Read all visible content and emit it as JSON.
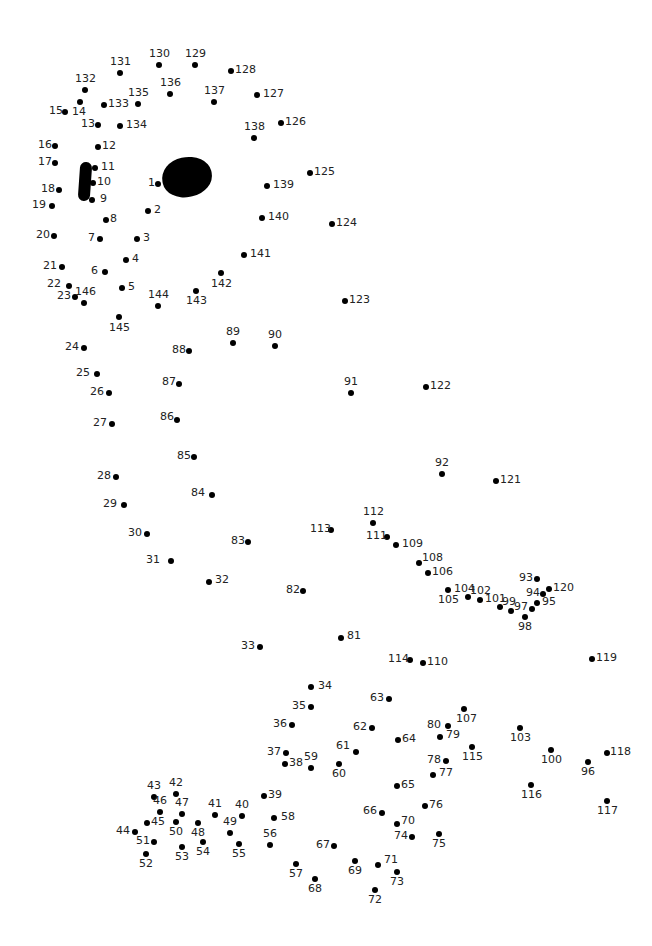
{
  "puzzle": {
    "type": "connect-the-dots",
    "dot_count": 146,
    "features": [
      {
        "name": "eye",
        "shape": "filled-oval"
      },
      {
        "name": "nostril",
        "shape": "filled-bar"
      }
    ],
    "dots": [
      {
        "n": "1",
        "x": 158,
        "y": 184,
        "lx": -10,
        "ly": -7
      },
      {
        "n": "2",
        "x": 148,
        "y": 211,
        "lx": 6,
        "ly": -7
      },
      {
        "n": "3",
        "x": 137,
        "y": 239,
        "lx": 6,
        "ly": -7
      },
      {
        "n": "4",
        "x": 126,
        "y": 260,
        "lx": 6,
        "ly": -7
      },
      {
        "n": "5",
        "x": 122,
        "y": 288,
        "lx": 6,
        "ly": -7
      },
      {
        "n": "6",
        "x": 105,
        "y": 272,
        "lx": -14,
        "ly": -7
      },
      {
        "n": "7",
        "x": 100,
        "y": 239,
        "lx": -12,
        "ly": -7
      },
      {
        "n": "8",
        "x": 106,
        "y": 220,
        "lx": 4,
        "ly": -7
      },
      {
        "n": "9",
        "x": 92,
        "y": 200,
        "lx": 8,
        "ly": -7
      },
      {
        "n": "10",
        "x": 93,
        "y": 183,
        "lx": 4,
        "ly": -7
      },
      {
        "n": "11",
        "x": 95,
        "y": 168,
        "lx": 6,
        "ly": -7
      },
      {
        "n": "12",
        "x": 98,
        "y": 147,
        "lx": 4,
        "ly": -7
      },
      {
        "n": "13",
        "x": 98,
        "y": 125,
        "lx": -17,
        "ly": -7
      },
      {
        "n": "14",
        "x": 80,
        "y": 102,
        "lx": -8,
        "ly": 4
      },
      {
        "n": "15",
        "x": 65,
        "y": 112,
        "lx": -16,
        "ly": -7
      },
      {
        "n": "16",
        "x": 55,
        "y": 146,
        "lx": -17,
        "ly": -7
      },
      {
        "n": "17",
        "x": 55,
        "y": 163,
        "lx": -17,
        "ly": -7
      },
      {
        "n": "18",
        "x": 59,
        "y": 190,
        "lx": -18,
        "ly": -7
      },
      {
        "n": "19",
        "x": 52,
        "y": 206,
        "lx": -20,
        "ly": -7
      },
      {
        "n": "20",
        "x": 54,
        "y": 236,
        "lx": -18,
        "ly": -7
      },
      {
        "n": "21",
        "x": 62,
        "y": 267,
        "lx": -19,
        "ly": -7
      },
      {
        "n": "22",
        "x": 69,
        "y": 286,
        "lx": -22,
        "ly": -8
      },
      {
        "n": "23",
        "x": 75,
        "y": 297,
        "lx": -18,
        "ly": -7
      },
      {
        "n": "24",
        "x": 84,
        "y": 348,
        "lx": -19,
        "ly": -7
      },
      {
        "n": "25",
        "x": 97,
        "y": 374,
        "lx": -21,
        "ly": -7
      },
      {
        "n": "26",
        "x": 109,
        "y": 393,
        "lx": -19,
        "ly": -7
      },
      {
        "n": "27",
        "x": 112,
        "y": 424,
        "lx": -19,
        "ly": -7
      },
      {
        "n": "28",
        "x": 116,
        "y": 477,
        "lx": -19,
        "ly": -7
      },
      {
        "n": "29",
        "x": 124,
        "y": 505,
        "lx": -21,
        "ly": -7
      },
      {
        "n": "30",
        "x": 147,
        "y": 534,
        "lx": -19,
        "ly": -7
      },
      {
        "n": "31",
        "x": 171,
        "y": 561,
        "lx": -25,
        "ly": -7
      },
      {
        "n": "32",
        "x": 209,
        "y": 582,
        "lx": 6,
        "ly": -8
      },
      {
        "n": "33",
        "x": 260,
        "y": 647,
        "lx": -19,
        "ly": -7
      },
      {
        "n": "34",
        "x": 311,
        "y": 687,
        "lx": 7,
        "ly": -7
      },
      {
        "n": "35",
        "x": 311,
        "y": 707,
        "lx": -19,
        "ly": -7
      },
      {
        "n": "36",
        "x": 292,
        "y": 725,
        "lx": -19,
        "ly": -7
      },
      {
        "n": "37",
        "x": 286,
        "y": 753,
        "lx": -19,
        "ly": -7
      },
      {
        "n": "38",
        "x": 285,
        "y": 764,
        "lx": 4,
        "ly": -7
      },
      {
        "n": "39",
        "x": 264,
        "y": 796,
        "lx": 4,
        "ly": -7
      },
      {
        "n": "40",
        "x": 242,
        "y": 816,
        "lx": -7,
        "ly": -17
      },
      {
        "n": "41",
        "x": 215,
        "y": 815,
        "lx": -7,
        "ly": -17
      },
      {
        "n": "42",
        "x": 176,
        "y": 794,
        "lx": -7,
        "ly": -17
      },
      {
        "n": "43",
        "x": 154,
        "y": 797,
        "lx": -7,
        "ly": -17
      },
      {
        "n": "44",
        "x": 135,
        "y": 832,
        "lx": -19,
        "ly": -7
      },
      {
        "n": "45",
        "x": 147,
        "y": 823,
        "lx": 4,
        "ly": -7
      },
      {
        "n": "46",
        "x": 160,
        "y": 812,
        "lx": -7,
        "ly": -17
      },
      {
        "n": "47",
        "x": 182,
        "y": 814,
        "lx": -7,
        "ly": -17
      },
      {
        "n": "48",
        "x": 198,
        "y": 823,
        "lx": -7,
        "ly": 4
      },
      {
        "n": "49",
        "x": 230,
        "y": 833,
        "lx": -7,
        "ly": -17
      },
      {
        "n": "50",
        "x": 176,
        "y": 822,
        "lx": -7,
        "ly": 4
      },
      {
        "n": "51",
        "x": 154,
        "y": 842,
        "lx": -18,
        "ly": -7
      },
      {
        "n": "52",
        "x": 146,
        "y": 854,
        "lx": -7,
        "ly": 4
      },
      {
        "n": "53",
        "x": 182,
        "y": 847,
        "lx": -7,
        "ly": 4
      },
      {
        "n": "54",
        "x": 203,
        "y": 842,
        "lx": -7,
        "ly": 4
      },
      {
        "n": "55",
        "x": 239,
        "y": 844,
        "lx": -7,
        "ly": 4
      },
      {
        "n": "56",
        "x": 270,
        "y": 845,
        "lx": -7,
        "ly": -17
      },
      {
        "n": "57",
        "x": 296,
        "y": 864,
        "lx": -7,
        "ly": 4
      },
      {
        "n": "58",
        "x": 274,
        "y": 818,
        "lx": 7,
        "ly": -7
      },
      {
        "n": "59",
        "x": 311,
        "y": 768,
        "lx": -7,
        "ly": -17
      },
      {
        "n": "60",
        "x": 339,
        "y": 764,
        "lx": -7,
        "ly": 4
      },
      {
        "n": "61",
        "x": 356,
        "y": 752,
        "lx": -20,
        "ly": -12
      },
      {
        "n": "62",
        "x": 372,
        "y": 728,
        "lx": -19,
        "ly": -7
      },
      {
        "n": "63",
        "x": 389,
        "y": 699,
        "lx": -19,
        "ly": -7
      },
      {
        "n": "64",
        "x": 398,
        "y": 740,
        "lx": 4,
        "ly": -7
      },
      {
        "n": "65",
        "x": 397,
        "y": 786,
        "lx": 4,
        "ly": -7
      },
      {
        "n": "66",
        "x": 382,
        "y": 813,
        "lx": -19,
        "ly": -8
      },
      {
        "n": "67",
        "x": 334,
        "y": 846,
        "lx": -18,
        "ly": -7
      },
      {
        "n": "68",
        "x": 315,
        "y": 879,
        "lx": -7,
        "ly": 4
      },
      {
        "n": "69",
        "x": 355,
        "y": 861,
        "lx": -7,
        "ly": 4
      },
      {
        "n": "70",
        "x": 397,
        "y": 824,
        "lx": 4,
        "ly": -9
      },
      {
        "n": "71",
        "x": 378,
        "y": 865,
        "lx": 6,
        "ly": -11
      },
      {
        "n": "72",
        "x": 375,
        "y": 890,
        "lx": -7,
        "ly": 4
      },
      {
        "n": "73",
        "x": 397,
        "y": 872,
        "lx": -7,
        "ly": 4
      },
      {
        "n": "74",
        "x": 412,
        "y": 837,
        "lx": -18,
        "ly": -7
      },
      {
        "n": "75",
        "x": 439,
        "y": 834,
        "lx": -7,
        "ly": 4
      },
      {
        "n": "76",
        "x": 425,
        "y": 806,
        "lx": 4,
        "ly": -7
      },
      {
        "n": "77",
        "x": 433,
        "y": 775,
        "lx": 6,
        "ly": -8
      },
      {
        "n": "78",
        "x": 446,
        "y": 761,
        "lx": -19,
        "ly": -7
      },
      {
        "n": "79",
        "x": 440,
        "y": 737,
        "lx": 6,
        "ly": -8
      },
      {
        "n": "80",
        "x": 448,
        "y": 726,
        "lx": -21,
        "ly": -7
      },
      {
        "n": "81",
        "x": 341,
        "y": 638,
        "lx": 6,
        "ly": -8
      },
      {
        "n": "82",
        "x": 303,
        "y": 591,
        "lx": -17,
        "ly": -7
      },
      {
        "n": "83",
        "x": 248,
        "y": 542,
        "lx": -17,
        "ly": -7
      },
      {
        "n": "84",
        "x": 212,
        "y": 495,
        "lx": -21,
        "ly": -8
      },
      {
        "n": "85",
        "x": 194,
        "y": 457,
        "lx": -17,
        "ly": -7
      },
      {
        "n": "86",
        "x": 177,
        "y": 420,
        "lx": -17,
        "ly": -9
      },
      {
        "n": "87",
        "x": 179,
        "y": 384,
        "lx": -17,
        "ly": -8
      },
      {
        "n": "88",
        "x": 189,
        "y": 351,
        "lx": -17,
        "ly": -7
      },
      {
        "n": "89",
        "x": 233,
        "y": 343,
        "lx": -7,
        "ly": -17
      },
      {
        "n": "90",
        "x": 275,
        "y": 346,
        "lx": -7,
        "ly": -17
      },
      {
        "n": "91",
        "x": 351,
        "y": 393,
        "lx": -7,
        "ly": -17
      },
      {
        "n": "92",
        "x": 442,
        "y": 474,
        "lx": -7,
        "ly": -17
      },
      {
        "n": "93",
        "x": 537,
        "y": 579,
        "lx": -18,
        "ly": -7
      },
      {
        "n": "94",
        "x": 543,
        "y": 594,
        "lx": -17,
        "ly": -7
      },
      {
        "n": "95",
        "x": 537,
        "y": 603,
        "lx": 5,
        "ly": -7
      },
      {
        "n": "96",
        "x": 588,
        "y": 762,
        "lx": -7,
        "ly": 4
      },
      {
        "n": "97",
        "x": 532,
        "y": 609,
        "lx": -18,
        "ly": -8
      },
      {
        "n": "98",
        "x": 525,
        "y": 617,
        "lx": -7,
        "ly": 4
      },
      {
        "n": "99",
        "x": 511,
        "y": 611,
        "lx": -9,
        "ly": -15
      },
      {
        "n": "100",
        "x": 551,
        "y": 750,
        "lx": -10,
        "ly": 4
      },
      {
        "n": "101",
        "x": 500,
        "y": 607,
        "lx": -15,
        "ly": -14
      },
      {
        "n": "102",
        "x": 480,
        "y": 600,
        "lx": -10,
        "ly": -15
      },
      {
        "n": "103",
        "x": 520,
        "y": 728,
        "lx": -10,
        "ly": 4
      },
      {
        "n": "104",
        "x": 468,
        "y": 597,
        "lx": -14,
        "ly": -14
      },
      {
        "n": "105",
        "x": 448,
        "y": 590,
        "lx": -10,
        "ly": 4
      },
      {
        "n": "106",
        "x": 428,
        "y": 573,
        "lx": 4,
        "ly": -7
      },
      {
        "n": "107",
        "x": 464,
        "y": 709,
        "lx": -8,
        "ly": 4
      },
      {
        "n": "108",
        "x": 419,
        "y": 563,
        "lx": 3,
        "ly": -11
      },
      {
        "n": "109",
        "x": 396,
        "y": 545,
        "lx": 6,
        "ly": -7
      },
      {
        "n": "110",
        "x": 423,
        "y": 663,
        "lx": 4,
        "ly": -7
      },
      {
        "n": "111",
        "x": 387,
        "y": 537,
        "lx": -21,
        "ly": -7
      },
      {
        "n": "112",
        "x": 373,
        "y": 523,
        "lx": -10,
        "ly": -17
      },
      {
        "n": "113",
        "x": 331,
        "y": 530,
        "lx": -21,
        "ly": -7
      },
      {
        "n": "114",
        "x": 410,
        "y": 660,
        "lx": -22,
        "ly": -7
      },
      {
        "n": "115",
        "x": 472,
        "y": 747,
        "lx": -10,
        "ly": 4
      },
      {
        "n": "116",
        "x": 531,
        "y": 785,
        "lx": -10,
        "ly": 4
      },
      {
        "n": "117",
        "x": 607,
        "y": 801,
        "lx": -10,
        "ly": 4
      },
      {
        "n": "118",
        "x": 607,
        "y": 753,
        "lx": 3,
        "ly": -7
      },
      {
        "n": "119",
        "x": 592,
        "y": 659,
        "lx": 4,
        "ly": -7
      },
      {
        "n": "120",
        "x": 549,
        "y": 589,
        "lx": 4,
        "ly": -7
      },
      {
        "n": "121",
        "x": 496,
        "y": 481,
        "lx": 4,
        "ly": -7
      },
      {
        "n": "122",
        "x": 426,
        "y": 387,
        "lx": 4,
        "ly": -7
      },
      {
        "n": "123",
        "x": 345,
        "y": 301,
        "lx": 4,
        "ly": -7
      },
      {
        "n": "124",
        "x": 332,
        "y": 224,
        "lx": 4,
        "ly": -7
      },
      {
        "n": "125",
        "x": 310,
        "y": 173,
        "lx": 4,
        "ly": -7
      },
      {
        "n": "126",
        "x": 281,
        "y": 123,
        "lx": 4,
        "ly": -7
      },
      {
        "n": "127",
        "x": 257,
        "y": 95,
        "lx": 6,
        "ly": -7
      },
      {
        "n": "128",
        "x": 231,
        "y": 71,
        "lx": 4,
        "ly": -7
      },
      {
        "n": "129",
        "x": 195,
        "y": 65,
        "lx": -10,
        "ly": -17
      },
      {
        "n": "130",
        "x": 159,
        "y": 65,
        "lx": -10,
        "ly": -17
      },
      {
        "n": "131",
        "x": 120,
        "y": 73,
        "lx": -10,
        "ly": -17
      },
      {
        "n": "132",
        "x": 85,
        "y": 90,
        "lx": -10,
        "ly": -17
      },
      {
        "n": "133",
        "x": 104,
        "y": 105,
        "lx": 4,
        "ly": -7
      },
      {
        "n": "134",
        "x": 120,
        "y": 126,
        "lx": 6,
        "ly": -7
      },
      {
        "n": "135",
        "x": 138,
        "y": 104,
        "lx": -10,
        "ly": -17
      },
      {
        "n": "136",
        "x": 170,
        "y": 94,
        "lx": -10,
        "ly": -17
      },
      {
        "n": "137",
        "x": 214,
        "y": 102,
        "lx": -10,
        "ly": -17
      },
      {
        "n": "138",
        "x": 254,
        "y": 138,
        "lx": -10,
        "ly": -17
      },
      {
        "n": "139",
        "x": 267,
        "y": 186,
        "lx": 6,
        "ly": -7
      },
      {
        "n": "140",
        "x": 262,
        "y": 218,
        "lx": 6,
        "ly": -7
      },
      {
        "n": "141",
        "x": 244,
        "y": 255,
        "lx": 6,
        "ly": -7
      },
      {
        "n": "142",
        "x": 221,
        "y": 273,
        "lx": -10,
        "ly": 5
      },
      {
        "n": "143",
        "x": 196,
        "y": 291,
        "lx": -10,
        "ly": 4
      },
      {
        "n": "144",
        "x": 158,
        "y": 306,
        "lx": -10,
        "ly": -17
      },
      {
        "n": "145",
        "x": 119,
        "y": 317,
        "lx": -10,
        "ly": 5
      },
      {
        "n": "146",
        "x": 84,
        "y": 303,
        "lx": -9,
        "ly": -17
      }
    ]
  }
}
